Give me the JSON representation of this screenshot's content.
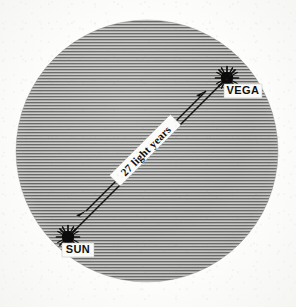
{
  "figure": {
    "type": "astronomical-distance-diagram",
    "background_color": "#fdfdfc",
    "field_fill_color": "#9a9a98",
    "hatch_line_color": "#5d5d5b",
    "ink_color": "#111111"
  },
  "field": {
    "name": "celestial-sphere-field",
    "shape": "circle",
    "center_x": 147,
    "center_y": 151,
    "radius": 131,
    "hatch_orientation": "horizontal",
    "hatch_spacing_px": 3
  },
  "stars": [
    {
      "id": "vega",
      "label": "VEGA",
      "x": 227,
      "y": 78,
      "glyph": "sunburst-star",
      "core_radius": 6.2,
      "spike_count": 12,
      "label_box": {
        "x": 224,
        "y": 84,
        "width": 38,
        "height": 14
      }
    },
    {
      "id": "sun",
      "label": "SUN",
      "x": 68,
      "y": 237,
      "glyph": "sunburst-star",
      "core_radius": 6.2,
      "spike_count": 12,
      "label_box": {
        "x": 62,
        "y": 243,
        "width": 32,
        "height": 14
      }
    }
  ],
  "connector": {
    "name": "sun-vega-sight-line",
    "from_x": 68,
    "from_y": 237,
    "to_x": 227,
    "to_y": 78,
    "style": "solid"
  },
  "measurement": {
    "name": "distance-measure-arrow",
    "value": "27",
    "unit": "light years",
    "text": "27 light years",
    "arrow_style": "double-headed",
    "from_x": 83,
    "from_y": 214,
    "to_x": 209,
    "to_y": 88,
    "text_rotation_deg": -45
  }
}
